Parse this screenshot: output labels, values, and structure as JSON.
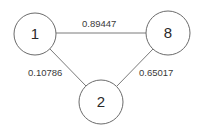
{
  "graph": {
    "nodes": [
      {
        "id": "1",
        "label": "1",
        "cx": 35,
        "cy": 34,
        "r": 21
      },
      {
        "id": "8",
        "label": "8",
        "cx": 168,
        "cy": 33,
        "r": 22
      },
      {
        "id": "2",
        "label": "2",
        "cx": 101,
        "cy": 102,
        "r": 22
      }
    ],
    "edges": [
      {
        "from": "1",
        "to": "8",
        "weight": "0.89447"
      },
      {
        "from": "1",
        "to": "2",
        "weight": "0.10786"
      },
      {
        "from": "8",
        "to": "2",
        "weight": "0.65017"
      }
    ]
  },
  "colors": {
    "node_stroke": "#6b6b6b",
    "edge_stroke": "#7a7a7a",
    "text": "#2a2a2a",
    "background": "#ffffff"
  }
}
